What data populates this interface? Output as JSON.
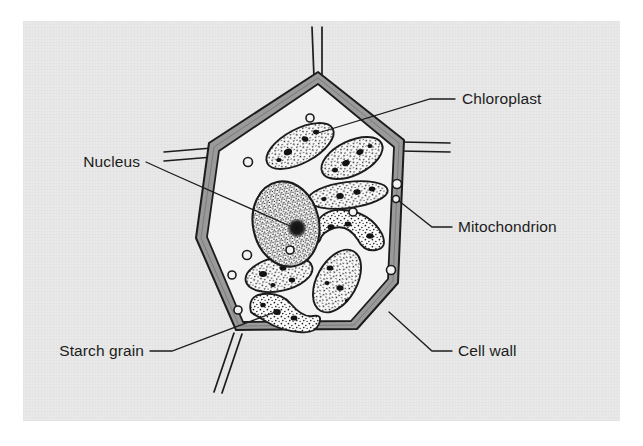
{
  "figure": {
    "kind": "biology-diagram",
    "background_color": "#ffffff",
    "panel_color": "#e9e9e9",
    "ink_color": "#1c1c1c",
    "wall_fill_color": "#9a9a9a",
    "cytoplasm_color": "#f2f2f2"
  },
  "labels": [
    {
      "id": "chloroplast",
      "text": "Chloroplast",
      "text_x": 462,
      "text_y": 104,
      "anchor": "start",
      "leader": [
        [
          455,
          99
        ],
        [
          430,
          99
        ],
        [
          318,
          133
        ]
      ]
    },
    {
      "id": "nucleus",
      "text": "Nucleus",
      "text_x": 140,
      "text_y": 167,
      "anchor": "end",
      "leader": [
        [
          146,
          162
        ],
        [
          168,
          172
        ],
        [
          268,
          216
        ]
      ]
    },
    {
      "id": "mitochondrion",
      "text": "Mitochondrion",
      "text_x": 458,
      "text_y": 232,
      "anchor": "start",
      "leader": [
        [
          452,
          227
        ],
        [
          432,
          227
        ],
        [
          396,
          198
        ]
      ]
    },
    {
      "id": "starch-grain",
      "text": "Starch grain",
      "text_x": 144,
      "text_y": 356,
      "anchor": "end",
      "leader": [
        [
          150,
          351
        ],
        [
          172,
          351
        ],
        [
          278,
          311
        ]
      ]
    },
    {
      "id": "cell-wall",
      "text": "Cell wall",
      "text_x": 458,
      "text_y": 356,
      "anchor": "start",
      "leader": [
        [
          452,
          351
        ],
        [
          432,
          351
        ],
        [
          390,
          314
        ]
      ]
    }
  ],
  "cell_wall": {
    "outline_points": "318,72 404,140 398,283 357,329 236,330 196,238 209,143",
    "inner_points": "318,84 394,145 388,279 352,321 242,322 206,237 218,150",
    "stubs": [
      {
        "id": "stub-top",
        "path": "M 318,72 L 316,28"
      },
      {
        "id": "stub-left",
        "path": "M 209,143 L 166,154"
      },
      {
        "id": "stub-right",
        "path": "M 404,140 L 449,146"
      },
      {
        "id": "stub-bottom-left",
        "path": "M 236,330 L 216,393"
      }
    ]
  },
  "organelles": {
    "nucleus": {
      "cx": 286,
      "cy": 224,
      "rx": 33,
      "ry": 43,
      "rotation": -12,
      "nucleolus": {
        "cx": 297,
        "cy": 228,
        "r": 9
      }
    },
    "chloroplasts": [
      {
        "id": "chloroplast-1",
        "cx": 300,
        "cy": 146,
        "rx": 37,
        "ry": 17,
        "rot": -28
      },
      {
        "id": "chloroplast-2",
        "cx": 352,
        "cy": 158,
        "rx": 33,
        "ry": 17,
        "rot": -26
      },
      {
        "id": "chloroplast-3",
        "cx": 348,
        "cy": 195,
        "rx": 40,
        "ry": 13,
        "rot": -7
      },
      {
        "id": "chloroplast-4",
        "cx": 352,
        "cy": 232,
        "rx": 38,
        "ry": 16,
        "rot": 4
      },
      {
        "id": "chloroplast-5",
        "cx": 279,
        "cy": 274,
        "rx": 34,
        "ry": 17,
        "rot": -12
      },
      {
        "id": "chloroplast-6",
        "cx": 337,
        "cy": 281,
        "rx": 20,
        "ry": 34,
        "rot": 29
      },
      {
        "id": "chloroplast-7",
        "cx": 282,
        "cy": 315,
        "rx": 33,
        "ry": 15,
        "rot": 10
      }
    ],
    "mitochondria": [
      {
        "id": "mito-1",
        "cx": 310,
        "cy": 118,
        "r": 4
      },
      {
        "id": "mito-2",
        "cx": 248,
        "cy": 162,
        "r": 4.5
      },
      {
        "id": "mito-3",
        "cx": 397,
        "cy": 184,
        "r": 4.5
      },
      {
        "id": "mito-4",
        "cx": 396,
        "cy": 198,
        "r": 3.5
      },
      {
        "id": "mito-5",
        "cx": 353,
        "cy": 212,
        "r": 4
      },
      {
        "id": "mito-6",
        "cx": 247,
        "cy": 255,
        "r": 4.5
      },
      {
        "id": "mito-7",
        "cx": 232,
        "cy": 275,
        "r": 4
      },
      {
        "id": "mito-8",
        "cx": 290,
        "cy": 250,
        "r": 4
      },
      {
        "id": "mito-9",
        "cx": 391,
        "cy": 270,
        "r": 4.5
      },
      {
        "id": "mito-10",
        "cx": 238,
        "cy": 310,
        "r": 4
      }
    ]
  }
}
